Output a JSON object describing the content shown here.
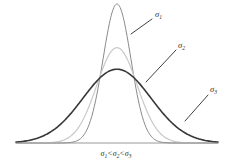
{
  "figure": {
    "title": "",
    "caption": {
      "full_text": "σ1<σ2<σ3",
      "parts": [
        {
          "base": "σ",
          "sub": "1",
          "op": "<"
        },
        {
          "base": "σ",
          "sub": "2",
          "op": "<"
        },
        {
          "base": "σ",
          "sub": "3",
          "op": ""
        }
      ]
    },
    "background_color": "#ffffff",
    "axis": {
      "visible": true,
      "color": "#8c8c8c",
      "x_start": 16,
      "x_end": 218,
      "y": 143
    }
  },
  "labels": [
    {
      "id": "sigma-1",
      "base": "σ",
      "sub": "1",
      "text": "σ1",
      "x": 155,
      "y": 17,
      "leader": {
        "x1": 152,
        "y1": 19,
        "x2": 131,
        "y2": 34
      },
      "color": "#2b2b2b"
    },
    {
      "id": "sigma-2",
      "base": "σ",
      "sub": "2",
      "text": "σ2",
      "x": 178,
      "y": 48,
      "leader": {
        "x1": 176,
        "y1": 50,
        "x2": 146,
        "y2": 82
      },
      "color": "#2b2b2b"
    },
    {
      "id": "sigma-3",
      "base": "σ",
      "sub": "3",
      "text": "σ3",
      "x": 210,
      "y": 92,
      "leader": {
        "x1": 208,
        "y1": 95,
        "x2": 185,
        "y2": 121
      },
      "color": "#2b2b2b"
    }
  ],
  "chart_data": {
    "type": "line",
    "title": "",
    "subtitle": "",
    "xlabel": "",
    "ylabel": "",
    "grid": false,
    "legend_position": "inline-annotations",
    "annotations": [
      "σ1",
      "σ2",
      "σ3",
      "σ1<σ2<σ3"
    ],
    "mean": 0,
    "x": [
      -4,
      -3.6,
      -3.2,
      -2.8,
      -2.4,
      -2,
      -1.6,
      -1.2,
      -0.8,
      -0.4,
      0,
      0.4,
      0.8,
      1.2,
      1.6,
      2,
      2.4,
      2.8,
      3.2,
      3.6,
      4
    ],
    "xlim": [
      -4,
      4
    ],
    "ylim": [
      0,
      1
    ],
    "series": [
      {
        "name": "σ1",
        "sigma": 0.55,
        "peak_value": 1.0,
        "color": "#8a8a8a",
        "stroke_width": 1.0,
        "values": [
          0,
          0,
          0,
          0,
          0.001,
          0.007,
          0.016,
          0.092,
          0.346,
          0.771,
          1.0,
          0.771,
          0.346,
          0.092,
          0.016,
          0.007,
          0.001,
          0,
          0,
          0,
          0
        ]
      },
      {
        "name": "σ2",
        "sigma": 0.8,
        "peak_value": 0.686,
        "color": "#c9c9c9",
        "stroke_width": 1.2,
        "values": [
          0,
          0.001,
          0.002,
          0.006,
          0.019,
          0.052,
          0.12,
          0.225,
          0.411,
          0.62,
          0.686,
          0.62,
          0.411,
          0.225,
          0.12,
          0.052,
          0.019,
          0.006,
          0.002,
          0.001,
          0
        ]
      },
      {
        "name": "σ3",
        "sigma": 1.35,
        "peak_value": 0.531,
        "color": "#383838",
        "stroke_width": 1.6,
        "values": [
          0.005,
          0.014,
          0.03,
          0.059,
          0.105,
          0.172,
          0.258,
          0.355,
          0.447,
          0.513,
          0.531,
          0.513,
          0.447,
          0.355,
          0.258,
          0.172,
          0.105,
          0.059,
          0.03,
          0.014,
          0.005
        ]
      }
    ]
  }
}
